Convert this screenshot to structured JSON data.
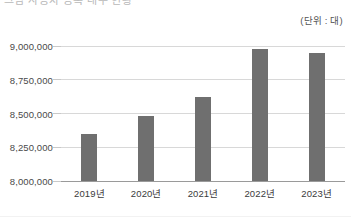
{
  "page": {
    "title_partial": "그림 자동차 등록 대수 현황",
    "unit_note": "(단위 : 대)"
  },
  "chart_data": {
    "type": "bar",
    "title": "",
    "subtitle": "",
    "xlabel": "",
    "ylabel": "",
    "unit": "(단위 : 대)",
    "categories": [
      "2019년",
      "2020년",
      "2021년",
      "2022년",
      "2023년"
    ],
    "values": [
      8350000,
      8480000,
      8620000,
      8980000,
      8945000
    ],
    "ylim": [
      8000000,
      9000000
    ],
    "yticks": [
      8000000,
      8250000,
      8500000,
      8750000,
      9000000
    ],
    "ytick_labels": [
      "8,000,000",
      "8,250,000",
      "8,500,000",
      "8,750,000",
      "9,000,000"
    ],
    "grid": true,
    "legend": false,
    "legend_position": "none",
    "series": [
      {
        "name": "등록 대수",
        "color": "#6f6f6f",
        "values": [
          8350000,
          8480000,
          8620000,
          8980000,
          8945000
        ]
      }
    ]
  },
  "colors": {
    "bar": "#6f6f6f",
    "gridline": "#d8d8d8",
    "baseline": "#9a9a9a",
    "text": "#3b3b3b",
    "muted_text": "#b9b9b9"
  }
}
